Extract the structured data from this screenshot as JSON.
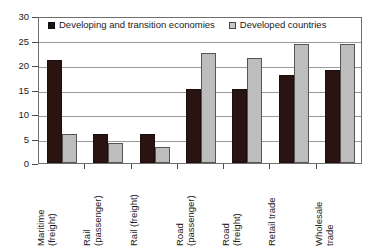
{
  "chart_data": {
    "type": "bar",
    "title": "",
    "subtitle": "",
    "xlabel": "",
    "ylabel": "",
    "ylim": [
      0,
      30
    ],
    "yticks": [
      0,
      5,
      10,
      15,
      20,
      25,
      30
    ],
    "ytick_labels": [
      "0",
      "5",
      "10",
      "15",
      "20",
      "25",
      "30"
    ],
    "grid": true,
    "grid_axis": "y",
    "legend_position": "top-inside",
    "orientation": "vertical",
    "bar_mode": "grouped",
    "categories": [
      "Maritime (freight)",
      "Rail (passenger)",
      "Rail (freight)",
      "Road (passenger)",
      "Road (freight)",
      "Retail trade",
      "Wholesale trade"
    ],
    "category_lines": [
      [
        "Maritime",
        "(freight)"
      ],
      [
        "Rail",
        "(passenger)"
      ],
      [
        "Rail (freight)",
        ""
      ],
      [
        "Road",
        "(passenger)"
      ],
      [
        "Road",
        "(freight)"
      ],
      [
        "Retail trade",
        ""
      ],
      [
        "Wholesale",
        "trade"
      ]
    ],
    "series": [
      {
        "name": "Developing and transition economies",
        "color": "#2a1411",
        "values": [
          21,
          6,
          6,
          15,
          15,
          18,
          19
        ]
      },
      {
        "name": "Developed countries",
        "color": "#bdbdbd",
        "values": [
          6,
          4,
          3.3,
          22.4,
          21.4,
          24.3,
          24.3
        ]
      }
    ]
  },
  "legend": {
    "items": [
      {
        "label": "Developing and transition economies",
        "swatch": "filled-dark-square"
      },
      {
        "label": "Developed countries",
        "swatch": "filled-light-square"
      }
    ]
  }
}
